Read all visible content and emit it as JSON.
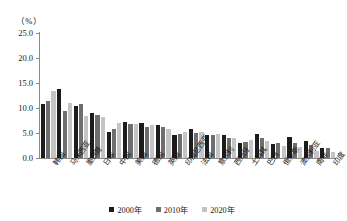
{
  "axis": {
    "unit_label": "（%）",
    "y_ticks": [
      "25.0",
      "20.0",
      "15.0",
      "10.0",
      "5.0",
      "0.0"
    ]
  },
  "legend": {
    "items": [
      {
        "label": "2000年",
        "color": "#1c1c1c"
      },
      {
        "label": "2010年",
        "color": "#6e6e6e"
      },
      {
        "label": "2020年",
        "color": "#c4c4c4"
      }
    ]
  },
  "chart_data": {
    "type": "bar",
    "title": "",
    "xlabel": "",
    "ylabel": "（%）",
    "ylim": [
      0.0,
      25.0
    ],
    "ytick_step": 5.0,
    "grid": false,
    "legend_position": "bottom-center",
    "categories": [
      "韩国",
      "马来西亚",
      "墨西哥",
      "日本",
      "中国",
      "美国",
      "德国",
      "英国",
      "印度尼西亚",
      "法国",
      "意大利",
      "西班牙",
      "土耳其",
      "巴西",
      "俄罗斯",
      "澳大利亚",
      "南非",
      "印度"
    ],
    "series": [
      {
        "name": "2000年",
        "color": "#1c1c1c",
        "values": [
          10.8,
          13.9,
          10.5,
          9.1,
          5.2,
          7.3,
          7.0,
          6.7,
          4.6,
          5.9,
          4.6,
          4.6,
          3.0,
          4.8,
          2.8,
          4.2,
          3.4,
          2.0
        ]
      },
      {
        "name": "2010年",
        "color": "#6e6e6e",
        "values": [
          11.5,
          9.5,
          10.8,
          8.6,
          5.8,
          6.9,
          6.3,
          6.2,
          4.9,
          5.1,
          4.6,
          4.1,
          3.3,
          4.1,
          3.0,
          3.1,
          2.6,
          2.1
        ]
      },
      {
        "name": "2020年",
        "color": "#c4c4c4",
        "values": [
          13.5,
          11.1,
          8.4,
          8.2,
          7.0,
          6.9,
          6.6,
          5.9,
          5.3,
          5.3,
          4.8,
          4.0,
          3.6,
          3.5,
          2.5,
          2.2,
          1.4,
          1.3
        ]
      }
    ]
  }
}
